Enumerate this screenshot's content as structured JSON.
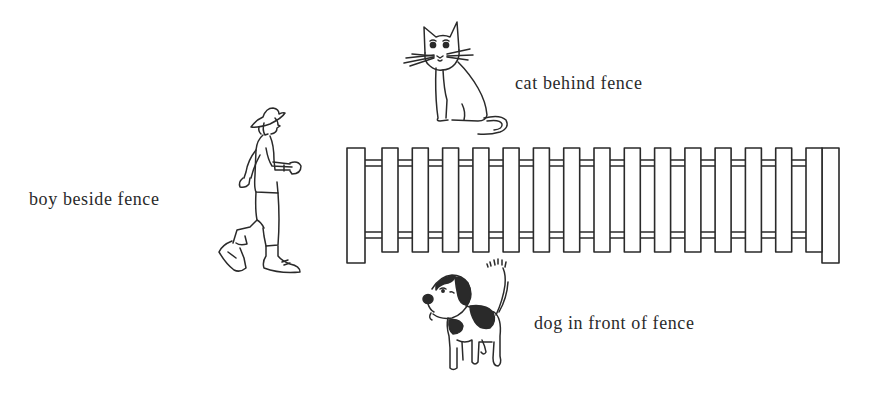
{
  "figure": {
    "type": "prepositions-illustration",
    "labels": {
      "cat": "cat behind fence",
      "boy": "boy beside fence",
      "dog": "dog in front of fence"
    },
    "fence": {
      "posts": 2,
      "pickets": 15,
      "rails": 2
    },
    "colors": {
      "ink": "#2a2a2a",
      "background": "#ffffff"
    }
  }
}
